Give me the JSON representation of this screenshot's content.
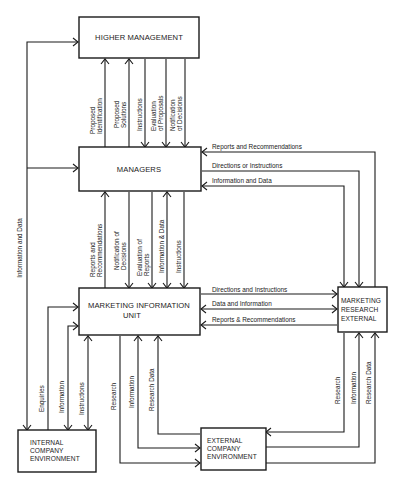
{
  "diagram": {
    "boxes": {
      "higher_management": {
        "lines": [
          "HIGHER MANAGEMENT"
        ]
      },
      "managers": {
        "lines": [
          "MANAGERS"
        ]
      },
      "miu": {
        "lines": [
          "MARKETING INFORMATION",
          "UNIT"
        ]
      },
      "mre": {
        "lines": [
          "MARKETING",
          "RESEARCH",
          "EXTERNAL"
        ]
      },
      "internal_env": {
        "lines": [
          "INTERNAL",
          "COMPANY",
          "ENVIRONMENT"
        ]
      },
      "external_env": {
        "lines": [
          "EXTERNAL",
          "COMPANY",
          "ENVIRONMENT"
        ]
      }
    },
    "flows": {
      "hm_managers": [
        {
          "lines": [
            "Proposed",
            "Identification"
          ],
          "direction": "up"
        },
        {
          "lines": [
            "Proposed",
            "Solutions"
          ],
          "direction": "up"
        },
        {
          "lines": [
            "Instructions"
          ],
          "direction": "down"
        },
        {
          "lines": [
            "Evaluation",
            "of Proposals"
          ],
          "direction": "down"
        },
        {
          "lines": [
            "Notification",
            "of Decisions"
          ],
          "direction": "down"
        }
      ],
      "managers_miu": [
        {
          "lines": [
            "Reports and",
            "Recommendations"
          ],
          "direction": "up"
        },
        {
          "lines": [
            "Notification of",
            "Decisions"
          ],
          "direction": "down"
        },
        {
          "lines": [
            "Evaluation of",
            "Reports"
          ],
          "direction": "down"
        },
        {
          "lines": [
            "Information & Data"
          ],
          "direction": "both"
        },
        {
          "lines": [
            "Instructions"
          ],
          "direction": "down"
        }
      ],
      "managers_mre": [
        {
          "label": "Reports and Recommendations",
          "direction": "to-managers"
        },
        {
          "label": "Directions or Instructions",
          "direction": "to-mre"
        },
        {
          "label": "Information and Data",
          "direction": "to-managers"
        }
      ],
      "miu_mre": [
        {
          "label": "Directions and Instructions",
          "direction": "to-mre"
        },
        {
          "label": "Data and Information",
          "direction": "both"
        },
        {
          "label": "Reports & Recommendations",
          "direction": "to-miu"
        }
      ],
      "internal_left": {
        "label": "Information and Data",
        "direction": "to-higher-management-and-managers"
      },
      "miu_internal": [
        {
          "label": "Enquiries",
          "direction": "to-miu"
        },
        {
          "label": "Information",
          "direction": "to-internal"
        },
        {
          "label": "Instructions",
          "direction": "both"
        }
      ],
      "miu_external": [
        {
          "label": "Research",
          "direction": "to-external"
        },
        {
          "label": "Information",
          "direction": "to-miu"
        },
        {
          "label": "Research Data",
          "direction": "to-miu"
        }
      ],
      "mre_external": [
        {
          "label": "Research",
          "direction": "to-external"
        },
        {
          "label": "Information",
          "direction": "to-mre"
        },
        {
          "label": "Research Data",
          "direction": "to-mre"
        }
      ]
    },
    "colors": {
      "ink": "#1a1a1a",
      "background": "#ffffff"
    }
  }
}
